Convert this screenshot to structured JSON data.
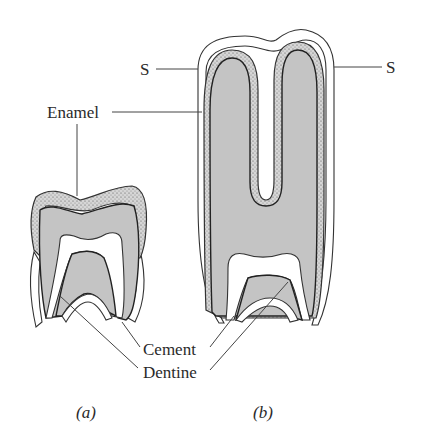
{
  "labels": {
    "s_left": "S",
    "s_right": "S",
    "enamel": "Enamel",
    "cement": "Cement",
    "dentine": "Dentine"
  },
  "captions": {
    "a": "(a)",
    "b": "(b)"
  },
  "colors": {
    "dentine": "#c4c4c4",
    "enamel_base": "#d8d8d8",
    "outline": "#333333",
    "background": "#ffffff"
  }
}
